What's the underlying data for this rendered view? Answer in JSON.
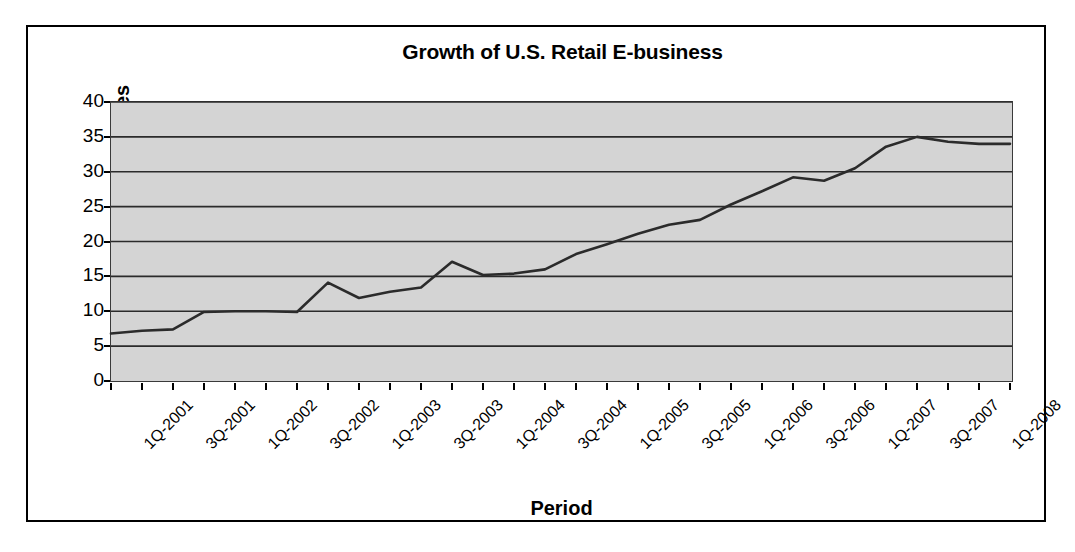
{
  "chart_data": {
    "type": "line",
    "title": "Growth of U.S. Retail E-business",
    "xlabel": "Period",
    "ylabel": "Billions in Sales",
    "ylim": [
      0,
      40
    ],
    "yticks": [
      0,
      5,
      10,
      15,
      20,
      25,
      30,
      35,
      40
    ],
    "grid": true,
    "legend": "none",
    "plot_background": "#d4d4d4",
    "line_color": "#2b2b2b",
    "categories": [
      "1Q-2001",
      "2Q-2001",
      "3Q-2001",
      "4Q-2001",
      "1Q-2002",
      "2Q-2002",
      "3Q-2002",
      "4Q-2002",
      "1Q-2003",
      "2Q-2003",
      "3Q-2003",
      "4Q-2003",
      "1Q-2004",
      "2Q-2004",
      "3Q-2004",
      "4Q-2004",
      "1Q-2005",
      "2Q-2005",
      "3Q-2005",
      "4Q-2005",
      "1Q-2006",
      "2Q-2006",
      "3Q-2006",
      "4Q-2006",
      "1Q-2007",
      "2Q-2007",
      "3Q-2007",
      "4Q-2007",
      "1Q-2008",
      "2Q-2008"
    ],
    "tick_labels": [
      "1Q-2001",
      "",
      "3Q-2001",
      "",
      "1Q-2002",
      "",
      "3Q-2002",
      "",
      "1Q-2003",
      "",
      "3Q-2003",
      "",
      "1Q-2004",
      "",
      "3Q-2004",
      "",
      "1Q-2005",
      "",
      "3Q-2005",
      "",
      "1Q-2006",
      "",
      "3Q-2006",
      "",
      "1Q-2007",
      "",
      "3Q-2007",
      "",
      "1Q-2008",
      ""
    ],
    "values": [
      6.8,
      7.2,
      7.4,
      9.9,
      10.0,
      10.0,
      9.9,
      14.1,
      11.9,
      12.8,
      13.4,
      17.1,
      15.2,
      15.4,
      16.0,
      18.2,
      19.6,
      21.1,
      22.4,
      23.1,
      25.3,
      27.2,
      29.2,
      28.7,
      30.5,
      33.6,
      35.0,
      34.3,
      34.0,
      34.0
    ],
    "series": [
      {
        "name": "U.S. Retail E-business Sales",
        "values": [
          6.8,
          7.2,
          7.4,
          9.9,
          10.0,
          10.0,
          9.9,
          14.1,
          11.9,
          12.8,
          13.4,
          17.1,
          15.2,
          15.4,
          16.0,
          18.2,
          19.6,
          21.1,
          22.4,
          23.1,
          25.3,
          27.2,
          29.2,
          28.7,
          30.5,
          33.6,
          35.0,
          34.3,
          34.0,
          34.0
        ]
      }
    ]
  }
}
